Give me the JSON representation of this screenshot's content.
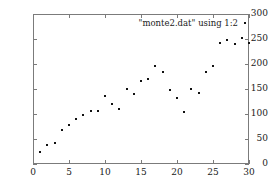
{
  "chart_data": {
    "type": "scatter",
    "title": "",
    "xlabel": "",
    "ylabel": "",
    "xlim": [
      0,
      30
    ],
    "ylim": [
      0,
      300
    ],
    "xticks": [
      0,
      5,
      10,
      15,
      20,
      25,
      30
    ],
    "yticks": [
      0,
      50,
      100,
      150,
      200,
      250,
      300
    ],
    "grid": false,
    "legend_position": "top-right",
    "series": [
      {
        "name": "\"monte2.dat\" using 1:2",
        "marker": "dot",
        "color": "#111111",
        "x": [
          1,
          2,
          3,
          4,
          5,
          6,
          7,
          8,
          9,
          10,
          11,
          12,
          13,
          14,
          15,
          16,
          17,
          18,
          19,
          20,
          21,
          22,
          23,
          24,
          25,
          26,
          27,
          28,
          29,
          30
        ],
        "y": [
          25,
          38,
          42,
          69,
          78,
          90,
          99,
          107,
          107,
          137,
          120,
          110,
          150,
          141,
          167,
          170,
          196,
          185,
          148,
          132,
          105,
          151,
          142,
          184,
          197,
          242,
          248,
          240,
          253,
          243
        ]
      }
    ]
  },
  "axes": {
    "x_tick_labels": [
      "0",
      "5",
      "10",
      "15",
      "20",
      "25",
      "30"
    ],
    "y_tick_labels": [
      "0",
      "50",
      "100",
      "150",
      "200",
      "250",
      "300"
    ]
  },
  "legend": {
    "label": "\"monte2.dat\" using 1:2"
  },
  "colors": {
    "frame": "#7b7b7b",
    "point": "#111111",
    "text": "#1a1a1a",
    "background": "#ffffff"
  }
}
